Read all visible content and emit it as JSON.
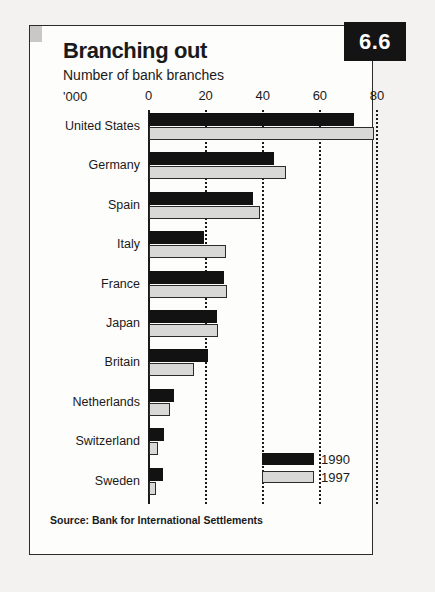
{
  "card": {
    "badge": "6.6",
    "title": "Branching out",
    "subtitle": "Number of bank branches",
    "unit": "'000",
    "source": "Source: Bank for International Settlements"
  },
  "legend": {
    "items": [
      {
        "label": "1990",
        "color": "#121212"
      },
      {
        "label": "1997",
        "color": "#d8d8d6"
      }
    ]
  },
  "chart_data": {
    "type": "bar",
    "orientation": "horizontal",
    "title": "Branching out",
    "subtitle": "Number of bank branches",
    "xlabel": "'000",
    "ylabel": "",
    "xlim": [
      0,
      80
    ],
    "xticks": [
      0,
      20,
      40,
      60,
      80
    ],
    "xtick_labels": [
      "0",
      "20",
      "40",
      "60",
      "80"
    ],
    "grid": "vertical-dotted",
    "legend_position": "bottom-right",
    "categories": [
      "United States",
      "Germany",
      "Spain",
      "Italy",
      "France",
      "Japan",
      "Britain",
      "Netherlands",
      "Switzerland",
      "Sweden"
    ],
    "series": [
      {
        "name": "1990",
        "color": "#121212",
        "values": [
          72.0,
          44.0,
          36.5,
          19.5,
          26.5,
          24.0,
          21.0,
          9.0,
          5.5,
          5.0
        ]
      },
      {
        "name": "1997",
        "color": "#d8d8d6",
        "values": [
          79.0,
          48.0,
          39.0,
          27.0,
          27.5,
          24.5,
          16.0,
          7.5,
          3.5,
          2.8
        ]
      }
    ],
    "source": "Source: Bank for International Settlements"
  }
}
